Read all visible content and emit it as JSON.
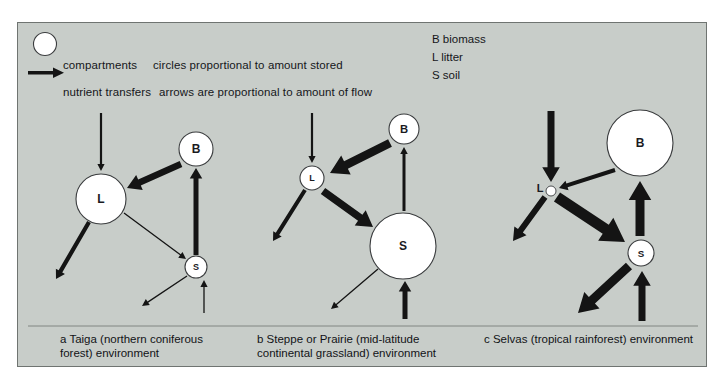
{
  "figure": {
    "background_color": "#c8cdc9",
    "border_color": "#6f7471",
    "ink_color": "#141414",
    "circle_fill": "#ffffff"
  },
  "legend": {
    "circle_symbol_label": "compartments",
    "circle_symbol_note": "circles proportional to amount stored",
    "arrow_symbol_label": "nutrient transfers",
    "arrow_symbol_note": "arrows are proportional to amount of flow",
    "circle_icon": "open-circle-icon",
    "arrow_icon": "thick-right-arrow-icon"
  },
  "key": {
    "items": [
      {
        "abbr": "B",
        "term": "B biomass"
      },
      {
        "abbr": "L",
        "term": "L litter"
      },
      {
        "abbr": "S",
        "term": "S soil"
      }
    ]
  },
  "captions": {
    "a": "a Taiga (northern coniferous\nforest) environment",
    "b": "b Steppe or Prairie (mid-latitude\ncontinental grassland) environment",
    "c": "c Selvas (tropical rainforest) environment"
  },
  "chart_data": {
    "type": "diagram",
    "note": "Circle area proportional to amount of nutrients stored; arrow width proportional to amount of flow.",
    "panels": [
      {
        "id": "a",
        "name": "Taiga (northern coniferous forest) environment",
        "nodes": [
          {
            "label": "L",
            "name": "litter",
            "cx": 100,
            "cy": 198,
            "r": 25,
            "size_rank": "large"
          },
          {
            "label": "B",
            "name": "biomass",
            "cx": 195,
            "cy": 148,
            "r": 17,
            "size_rank": "medium"
          },
          {
            "label": "S",
            "name": "soil",
            "cx": 195,
            "cy": 266,
            "r": 11,
            "size_rank": "small"
          }
        ],
        "flows": [
          {
            "from": "precipitation-input",
            "to": "L",
            "x1": 100,
            "y1": 112,
            "x2": 100,
            "y2": 170,
            "width": 2.2,
            "magnitude": "small"
          },
          {
            "from": "B",
            "to": "L",
            "x1": 180,
            "y1": 163,
            "x2": 126,
            "y2": 187,
            "width": 6.5,
            "magnitude": "large"
          },
          {
            "from": "S",
            "to": "B",
            "x1": 195,
            "y1": 254,
            "x2": 195,
            "y2": 167,
            "width": 5.0,
            "magnitude": "large"
          },
          {
            "from": "L",
            "to": "runoff-loss",
            "x1": 88,
            "y1": 221,
            "x2": 55,
            "y2": 278,
            "width": 4.2,
            "magnitude": "medium"
          },
          {
            "from": "L",
            "to": "S",
            "x1": 123,
            "y1": 212,
            "x2": 185,
            "y2": 258,
            "width": 1.3,
            "magnitude": "very-small"
          },
          {
            "from": "S",
            "to": "leaching-loss",
            "x1": 186,
            "y1": 275,
            "x2": 141,
            "y2": 305,
            "width": 1.3,
            "magnitude": "very-small"
          },
          {
            "from": "weathering-input",
            "to": "S",
            "x1": 203,
            "y1": 312,
            "x2": 203,
            "y2": 279,
            "width": 1.3,
            "magnitude": "very-small"
          }
        ]
      },
      {
        "id": "b",
        "name": "Steppe or Prairie (mid-latitude continental grassland) environment",
        "nodes": [
          {
            "label": "L",
            "name": "litter",
            "cx": 311,
            "cy": 177,
            "r": 12,
            "size_rank": "small"
          },
          {
            "label": "B",
            "name": "biomass",
            "cx": 403,
            "cy": 128,
            "r": 15,
            "size_rank": "medium"
          },
          {
            "label": "S",
            "name": "soil",
            "cx": 402,
            "cy": 245,
            "r": 33,
            "size_rank": "large"
          }
        ],
        "flows": [
          {
            "from": "precipitation-input",
            "to": "L",
            "x1": 311,
            "y1": 112,
            "x2": 311,
            "y2": 162,
            "width": 2.2,
            "magnitude": "small"
          },
          {
            "from": "B",
            "to": "L",
            "x1": 389,
            "y1": 142,
            "x2": 329,
            "y2": 172,
            "width": 8.5,
            "magnitude": "very-large"
          },
          {
            "from": "L",
            "to": "S",
            "x1": 322,
            "y1": 190,
            "x2": 372,
            "y2": 226,
            "width": 7.5,
            "magnitude": "very-large"
          },
          {
            "from": "S",
            "to": "B",
            "x1": 403,
            "y1": 210,
            "x2": 403,
            "y2": 146,
            "width": 3.0,
            "magnitude": "medium"
          },
          {
            "from": "L",
            "to": "runoff-loss",
            "x1": 304,
            "y1": 189,
            "x2": 272,
            "y2": 240,
            "width": 4.0,
            "magnitude": "medium"
          },
          {
            "from": "S",
            "to": "leaching-loss",
            "x1": 377,
            "y1": 268,
            "x2": 330,
            "y2": 308,
            "width": 1.3,
            "magnitude": "very-small"
          },
          {
            "from": "weathering-input",
            "to": "S",
            "x1": 404,
            "y1": 318,
            "x2": 404,
            "y2": 280,
            "width": 5.0,
            "magnitude": "large"
          }
        ]
      },
      {
        "id": "c",
        "name": "Selvas (tropical rainforest) environment",
        "nodes": [
          {
            "label": "L",
            "name": "litter",
            "cx": 550,
            "cy": 190,
            "r": 5,
            "size_rank": "very-small"
          },
          {
            "label": "B",
            "name": "biomass",
            "cx": 639,
            "cy": 142,
            "r": 33,
            "size_rank": "large"
          },
          {
            "label": "S",
            "name": "soil",
            "cx": 640,
            "cy": 252,
            "r": 13,
            "size_rank": "small"
          }
        ],
        "flows": [
          {
            "from": "precipitation-input",
            "to": "L",
            "x1": 550,
            "y1": 110,
            "x2": 550,
            "y2": 181,
            "width": 7.0,
            "magnitude": "large"
          },
          {
            "from": "B",
            "to": "L",
            "x1": 614,
            "y1": 169,
            "x2": 558,
            "y2": 187,
            "width": 4.0,
            "magnitude": "medium"
          },
          {
            "from": "L",
            "to": "S",
            "x1": 556,
            "y1": 196,
            "x2": 624,
            "y2": 241,
            "width": 11.0,
            "magnitude": "very-large"
          },
          {
            "from": "S",
            "to": "B",
            "x1": 639,
            "y1": 235,
            "x2": 639,
            "y2": 180,
            "width": 9.0,
            "magnitude": "very-large"
          },
          {
            "from": "L",
            "to": "runoff-loss",
            "x1": 544,
            "y1": 196,
            "x2": 512,
            "y2": 240,
            "width": 6.0,
            "magnitude": "large"
          },
          {
            "from": "S",
            "to": "leaching-loss",
            "x1": 628,
            "y1": 265,
            "x2": 577,
            "y2": 312,
            "width": 9.0,
            "magnitude": "very-large"
          },
          {
            "from": "weathering-input",
            "to": "S",
            "x1": 641,
            "y1": 320,
            "x2": 641,
            "y2": 270,
            "width": 7.0,
            "magnitude": "large"
          }
        ]
      }
    ]
  }
}
